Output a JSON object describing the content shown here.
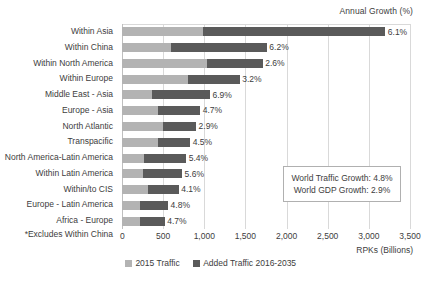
{
  "chart_data": {
    "type": "bar",
    "orientation": "horizontal",
    "stacked": true,
    "title": "Annual Growth (%)",
    "xlabel": "RPKs (Billions)",
    "ylabel": "",
    "xlim": [
      0,
      3500
    ],
    "xticks": [
      "0",
      "500",
      "1,000",
      "1,500",
      "2,000",
      "2,500",
      "3,000",
      "3,500"
    ],
    "xtick_values": [
      0,
      500,
      1000,
      1500,
      2000,
      2500,
      3000,
      3500
    ],
    "grid": true,
    "legend_position": "bottom",
    "categories": [
      "Within Asia",
      "Within China",
      "Within North America",
      "Within Europe",
      "Middle East - Asia",
      "Europe - Asia",
      "North Atlantic",
      "Transpacific",
      "North America-Latin America",
      "Within Latin America",
      "Within/to CIS",
      "Europe - Latin America",
      "Africa - Europe"
    ],
    "series": [
      {
        "name": "2015 Traffic",
        "color": "#b3b3b3",
        "values": [
          990,
          590,
          1030,
          800,
          370,
          440,
          500,
          440,
          270,
          260,
          320,
          220,
          220
        ]
      },
      {
        "name": "Added Traffic 2016-2035",
        "color": "#5a5a5a",
        "values": [
          2210,
          1170,
          680,
          630,
          700,
          510,
          400,
          390,
          510,
          470,
          370,
          340,
          300
        ]
      }
    ],
    "data_labels": [
      "6.1%",
      "6.2%",
      "2.6%",
      "3.2%",
      "6.9%",
      "4.7%",
      "2.9%",
      "4.5%",
      "5.4%",
      "5.6%",
      "4.1%",
      "4.8%",
      "4.7%"
    ],
    "annotations": [
      "World Traffic Growth: 4.8%",
      "World GDP Growth: 2.9%"
    ],
    "footnote": "*Excludes Within China"
  },
  "legend": {
    "items": [
      {
        "label": "2015 Traffic",
        "color": "#b3b3b3"
      },
      {
        "label": "Added Traffic 2016-2035",
        "color": "#5a5a5a"
      }
    ]
  }
}
